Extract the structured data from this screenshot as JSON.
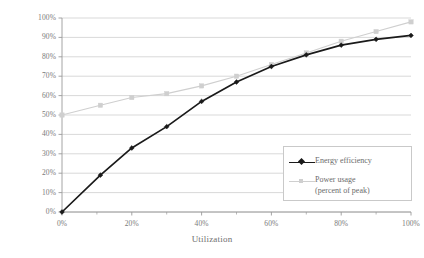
{
  "chart_data": {
    "type": "line",
    "title": "",
    "xlabel": "Utilization",
    "ylabel": "",
    "xlim": [
      0,
      100
    ],
    "ylim": [
      0,
      100
    ],
    "grid": true,
    "grid_axis": "y",
    "legend_position": "bottom-right",
    "x_tick_labels": [
      "0%",
      "20%",
      "40%",
      "60%",
      "80%",
      "100%"
    ],
    "x_tick_values": [
      0,
      20,
      40,
      60,
      80,
      100
    ],
    "x_minor_tick_values": [
      10,
      30,
      50,
      70,
      90
    ],
    "y_tick_labels": [
      "0%",
      "10%",
      "20%",
      "30%",
      "40%",
      "50%",
      "60%",
      "70%",
      "80%",
      "90%",
      "100%"
    ],
    "y_tick_values": [
      0,
      10,
      20,
      30,
      40,
      50,
      60,
      70,
      80,
      90,
      100
    ],
    "series": [
      {
        "name": "Energy efficiency",
        "color": "#1a1a1a",
        "marker": "diamond",
        "x": [
          0,
          11,
          20,
          30,
          40,
          50,
          60,
          70,
          80,
          90,
          100
        ],
        "values": [
          0,
          19,
          33,
          44,
          57,
          67,
          75,
          81,
          86,
          89,
          91
        ]
      },
      {
        "name": "Power usage (percent of peak)",
        "color": "#cfcfcf",
        "marker": "square",
        "x": [
          0,
          11,
          20,
          30,
          40,
          50,
          60,
          70,
          80,
          90,
          100
        ],
        "values": [
          50,
          55,
          59,
          61,
          65,
          70,
          76,
          82,
          88,
          93,
          98
        ]
      }
    ]
  },
  "legend": {
    "items": [
      {
        "label": "Energy efficiency",
        "color": "#1a1a1a",
        "marker": "diamond"
      },
      {
        "label": "Power usage\n(percent of peak)",
        "color": "#cfcfcf",
        "marker": "square"
      }
    ]
  },
  "colors": {
    "energy_efficiency": "#1a1a1a",
    "power_usage": "#cfcfcf",
    "gridline": "#c8c8c8",
    "axis": "#9a9a9a",
    "text": "#6b6b6b",
    "background": "#ffffff"
  }
}
